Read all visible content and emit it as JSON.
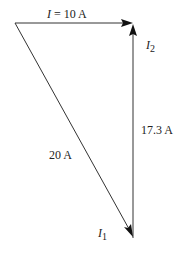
{
  "diagram": {
    "vectors": [
      {
        "id": "I",
        "symbol": "I",
        "value_label": "10 A",
        "label": "I = 10 A"
      },
      {
        "id": "I2",
        "symbol": "I",
        "subscript": "2",
        "value_label": "17.3 A"
      },
      {
        "id": "I1",
        "symbol": "I",
        "subscript": "1",
        "value_label": "20 A"
      }
    ],
    "labels": {
      "top_symbol": "I",
      "top_eq": " = 10 A",
      "i2_symbol": "I",
      "i2_sub": "2",
      "i2_value": "17.3 A",
      "i1_symbol": "I",
      "i1_sub": "1",
      "i1_value": "20 A"
    },
    "colors": {
      "stroke": "#333333",
      "arrowhead": "#111111",
      "text": "#222222"
    }
  }
}
